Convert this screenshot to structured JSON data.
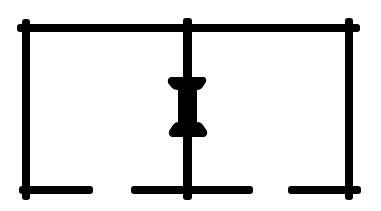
{
  "diagram": {
    "type": "circuit-schematic",
    "colors": {
      "line": "#000000",
      "background": "#ffffff"
    },
    "elements": {
      "top_rail": "top-conductor",
      "left_post": "left-vertical-conductor",
      "middle_post": "middle-vertical-conductor",
      "right_post": "right-vertical-conductor",
      "component": "i-beam-component-symbol",
      "bottom_left": "bottom-left-terminal-segment",
      "bottom_middle": "bottom-middle-terminal-segment",
      "bottom_right": "bottom-right-terminal-segment"
    }
  }
}
